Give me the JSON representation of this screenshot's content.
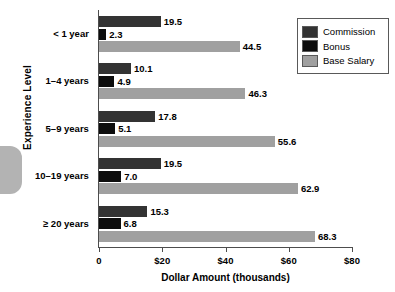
{
  "chart_data": {
    "type": "bar",
    "orientation": "horizontal",
    "title": "",
    "xlabel": "Dollar Amount (thousands)",
    "ylabel": "Experience Level",
    "categories": [
      "< 1 year",
      "1–4 years",
      "5–9 years",
      "10–19 years",
      "≥ 20 years"
    ],
    "series": [
      {
        "name": "Commission",
        "color": "#333333",
        "values": [
          19.5,
          10.1,
          17.8,
          19.5,
          15.3
        ]
      },
      {
        "name": "Bonus",
        "color": "#0d0d0d",
        "values": [
          2.3,
          4.9,
          5.1,
          7.0,
          6.8
        ]
      },
      {
        "name": "Base Salary",
        "color": "#a0a0a0",
        "values": [
          44.5,
          46.3,
          55.6,
          62.9,
          68.3
        ]
      }
    ],
    "value_labels": [
      [
        "19.5",
        "2.3",
        "44.5"
      ],
      [
        "10.1",
        "4.9",
        "46.3"
      ],
      [
        "17.8",
        "5.1",
        "55.6"
      ],
      [
        "19.5",
        "7.0",
        "62.9"
      ],
      [
        "15.3",
        "6.8",
        "68.3"
      ]
    ],
    "xlim": [
      0,
      80
    ],
    "xticks": [
      0,
      20,
      40,
      60,
      80
    ],
    "xtick_labels": [
      "0",
      "$20",
      "$40",
      "$60",
      "$80"
    ],
    "grid": false,
    "legend_position": "top-right"
  },
  "legend": {
    "entries": [
      {
        "label": "Commission"
      },
      {
        "label": "Bonus"
      },
      {
        "label": "Base Salary"
      }
    ]
  }
}
